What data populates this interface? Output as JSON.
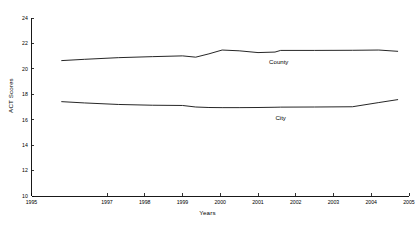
{
  "chart_data": {
    "type": "line",
    "title": "Figure 1.  Comparison of ACT Scores",
    "xlabel": "Years",
    "ylabel": "ACT Scores",
    "xlim": [
      1995,
      2005
    ],
    "ylim": [
      10,
      24
    ],
    "grid": false,
    "legend_position": "inline-annotation",
    "x_ticks": [
      1995,
      1997,
      1998,
      1999,
      2000,
      2001,
      2002,
      2003,
      2004,
      2005
    ],
    "x_tick_labels": [
      "1995",
      "1997",
      "1998",
      "1999",
      "2000",
      "2001",
      "2002",
      "2003",
      "2004",
      "2005"
    ],
    "y_ticks": [
      10,
      12,
      14,
      16,
      18,
      20,
      22,
      24
    ],
    "y_tick_labels": [
      "10",
      "12",
      "14",
      "16",
      "18",
      "20",
      "22",
      "24"
    ],
    "x": [
      1995.8,
      1996.4,
      1997.3,
      1998.2,
      1999.0,
      1999.35,
      1999.7,
      2000.05,
      2000.5,
      2001.0,
      2001.45,
      2001.6,
      2002.5,
      2003.5,
      2004.2,
      2004.7
    ],
    "series": [
      {
        "name": "County",
        "label": "County",
        "color": "#1a1a1a",
        "values": [
          20.65,
          20.75,
          20.88,
          20.96,
          21.02,
          20.92,
          21.18,
          21.48,
          21.42,
          21.28,
          21.32,
          21.45,
          21.45,
          21.46,
          21.48,
          21.38
        ]
      },
      {
        "name": "City",
        "label": "City",
        "color": "#1a1a1a",
        "values": [
          17.42,
          17.32,
          17.2,
          17.14,
          17.12,
          17.0,
          16.96,
          16.95,
          16.95,
          16.96,
          16.98,
          16.99,
          17.0,
          17.02,
          17.35,
          17.58
        ]
      }
    ],
    "annotations": [
      {
        "text": "County",
        "x": 2001.55,
        "y": 20.35
      },
      {
        "text": "City",
        "x": 2001.6,
        "y": 15.95
      }
    ]
  }
}
